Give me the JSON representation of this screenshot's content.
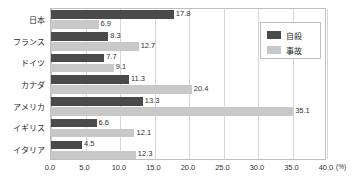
{
  "chart_data": {
    "type": "bar",
    "orientation": "horizontal",
    "title": "",
    "xlabel": "(%)",
    "ylabel": "",
    "xlim": [
      0.0,
      40.0
    ],
    "xticks": [
      "0.0",
      "5.0",
      "10.0",
      "15.0",
      "20.0",
      "25.0",
      "30.0",
      "35.0",
      "40.0"
    ],
    "xtick_values": [
      0,
      5,
      10,
      15,
      20,
      25,
      30,
      35,
      40
    ],
    "grid": true,
    "legend_position": "top-right-inside",
    "categories": [
      "日本",
      "フランス",
      "ドイツ",
      "カナダ",
      "アメリカ",
      "イギリス",
      "イタリア"
    ],
    "series": [
      {
        "name": "自殺",
        "color": "#4a4a4a",
        "values": [
          17.8,
          8.3,
          7.7,
          11.3,
          13.3,
          6.6,
          4.5
        ],
        "labels": [
          "17.8",
          "8.3",
          "7.7",
          "11.3",
          "13.3",
          "6.6",
          "4.5"
        ]
      },
      {
        "name": "事故",
        "color": "#c8c8c8",
        "values": [
          6.9,
          12.7,
          9.1,
          20.4,
          35.1,
          12.1,
          12.3
        ],
        "labels": [
          "6.9",
          "12.7",
          "9.1",
          "20.4",
          "35.1",
          "12.1",
          "12.3"
        ]
      }
    ]
  },
  "legend": {
    "entries": [
      {
        "label": "自殺",
        "color": "#4a4a4a"
      },
      {
        "label": "事故",
        "color": "#c8c8c8"
      }
    ]
  },
  "axis": {
    "unit": "(%)"
  },
  "colors": {
    "series_suicide": "#4a4a4a",
    "series_accident": "#c8c8c8",
    "gridline": "#d6d6d6",
    "frame": "#bfbfbf",
    "text": "#2b2b2b",
    "background": "#ffffff"
  }
}
